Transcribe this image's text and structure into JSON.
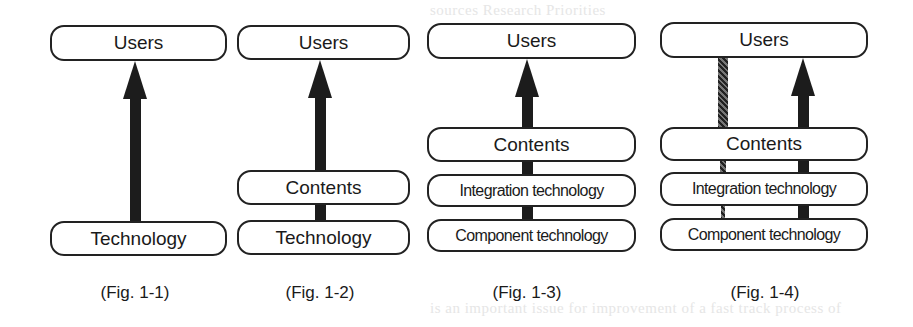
{
  "bleed_through": {
    "top_lines": [
      "sources    Research   Priorities",
      "   .       .           .",
      "      Bar              "
    ],
    "bottom_lines": [
      "is an important issue for improvement of a fast track process of",
      "and research. It is important to create a design and develop"
    ]
  },
  "figures": [
    {
      "id": "fig-1-1",
      "caption": "(Fig. 1-1)",
      "boxes": [
        {
          "label": "Users"
        },
        {
          "label": "Technology"
        }
      ],
      "connectors": [
        {
          "from": "Technology",
          "to": "Users",
          "style": "solid-arrow"
        }
      ]
    },
    {
      "id": "fig-1-2",
      "caption": "(Fig. 1-2)",
      "boxes": [
        {
          "label": "Users"
        },
        {
          "label": "Contents"
        },
        {
          "label": "Technology"
        }
      ],
      "connectors": [
        {
          "from": "Technology",
          "to": "Contents",
          "style": "solid-bar"
        },
        {
          "from": "Contents",
          "to": "Users",
          "style": "solid-arrow"
        }
      ]
    },
    {
      "id": "fig-1-3",
      "caption": "(Fig. 1-3)",
      "boxes": [
        {
          "label": "Users"
        },
        {
          "label": "Contents"
        },
        {
          "label": "Integration technology"
        },
        {
          "label": "Component technology"
        }
      ],
      "connectors": [
        {
          "from": "Component technology",
          "to": "Integration technology",
          "style": "solid-bar"
        },
        {
          "from": "Integration technology",
          "to": "Contents",
          "style": "solid-bar"
        },
        {
          "from": "Contents",
          "to": "Users",
          "style": "solid-arrow"
        }
      ]
    },
    {
      "id": "fig-1-4",
      "caption": "(Fig. 1-4)",
      "boxes": [
        {
          "label": "Users"
        },
        {
          "label": "Contents"
        },
        {
          "label": "Integration technology"
        },
        {
          "label": "Component technology"
        }
      ],
      "connectors": [
        {
          "from": "Component technology",
          "to": "Users",
          "style": "hatched-bar"
        },
        {
          "from": "Component technology",
          "to": "Users",
          "style": "solid-arrow"
        }
      ]
    }
  ],
  "colors": {
    "stroke": "#222222",
    "fill": "#ffffff",
    "bar": "#1c1c1c"
  }
}
